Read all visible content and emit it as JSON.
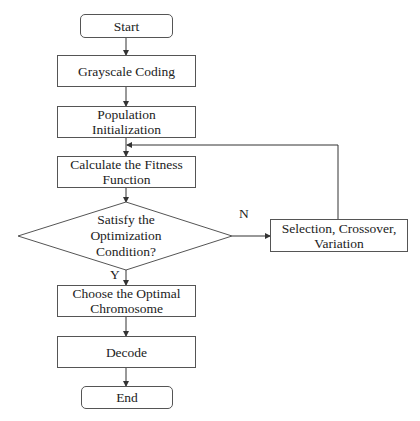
{
  "diagram": {
    "type": "flowchart",
    "title": "",
    "nodes": {
      "start": {
        "label": "Start",
        "shape": "rounded-rect"
      },
      "grayscale": {
        "label": "Grayscale Coding",
        "shape": "rect"
      },
      "population": {
        "label": "Population Initialization",
        "line1": "Population",
        "line2": "Initialization",
        "shape": "rect"
      },
      "fitness": {
        "label": "Calculate the Fitness Function",
        "line1": "Calculate the Fitness",
        "line2": "Function",
        "shape": "rect"
      },
      "condition": {
        "label": "Satisfy the Optimization Condition?",
        "line1": "Satisfy the",
        "line2": "Optimization",
        "line3": "Condition?",
        "shape": "diamond"
      },
      "selection": {
        "label": "Selection, Crossover, Variation",
        "line1": "Selection, Crossover,",
        "line2": "Variation",
        "shape": "rect"
      },
      "choose": {
        "label": "Choose the Optimal Chromosome",
        "line1": "Choose the Optimal",
        "line2": "Chromosome",
        "shape": "rect"
      },
      "decode": {
        "label": "Decode",
        "shape": "rect"
      },
      "end": {
        "label": "End",
        "shape": "rounded-rect"
      }
    },
    "edges": [
      {
        "from": "start",
        "to": "grayscale",
        "label": ""
      },
      {
        "from": "grayscale",
        "to": "population",
        "label": ""
      },
      {
        "from": "population",
        "to": "fitness",
        "label": ""
      },
      {
        "from": "fitness",
        "to": "condition",
        "label": ""
      },
      {
        "from": "condition",
        "to": "selection",
        "label": "N"
      },
      {
        "from": "selection",
        "to": "fitness",
        "label": ""
      },
      {
        "from": "condition",
        "to": "choose",
        "label": "Y"
      },
      {
        "from": "choose",
        "to": "decode",
        "label": ""
      },
      {
        "from": "decode",
        "to": "end",
        "label": ""
      }
    ],
    "edge_labels": {
      "no": "N",
      "yes": "Y"
    },
    "colors": {
      "stroke": "#555555",
      "text": "#222222",
      "background": "#ffffff"
    }
  }
}
